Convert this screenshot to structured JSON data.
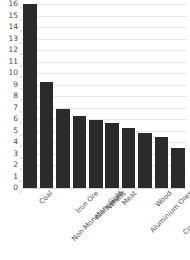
{
  "chart_data": {
    "type": "bar",
    "title": "",
    "subtitle": "",
    "xlabel": "",
    "ylabel": "",
    "ylim": [
      0,
      16
    ],
    "grid": true,
    "legend": false,
    "orientation": "vertical",
    "bar_color": "#2b2b2b",
    "background_color": "#ffffff",
    "gridline_color": "#e8e8e8",
    "categories": [
      "Coal",
      "Non-Monetary Gold",
      "Iron Ore",
      "Aluminium",
      "Wheat",
      "Meat",
      "Aluminium Ores",
      "Wood",
      "Crude Petroleum",
      "Refined Petroleum"
    ],
    "values": [
      16.0,
      9.2,
      6.9,
      6.3,
      5.9,
      5.65,
      5.25,
      4.75,
      4.4,
      3.45
    ],
    "y_ticks": [
      0,
      1,
      2,
      3,
      4,
      5,
      6,
      7,
      8,
      9,
      10,
      11,
      12,
      13,
      14,
      15,
      16
    ],
    "y_tick_labels": [
      "0",
      "1",
      "2",
      "3",
      "4",
      "5",
      "6",
      "7",
      "8",
      "9",
      "10",
      "11",
      "12",
      "13",
      "14",
      "15",
      "16"
    ]
  }
}
